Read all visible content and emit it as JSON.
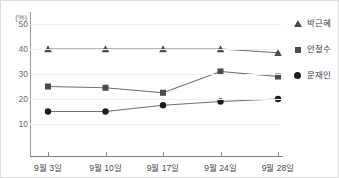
{
  "top_strip": {
    "cut_off_text": ""
  },
  "chart_data": {
    "type": "line",
    "title": "",
    "subtitle": "",
    "xlabel": "",
    "ylabel": "(%)",
    "unit": "(%)",
    "categories": [
      "9월 3일",
      "9월 10일",
      "9월 17일",
      "9월 24일",
      "9월 28일"
    ],
    "ylim": [
      0,
      55
    ],
    "yticks": [
      10,
      20,
      30,
      40,
      50
    ],
    "ytick_labels": [
      "10",
      "20",
      "30",
      "40",
      "50"
    ],
    "grid": true,
    "legend_position": "right",
    "series": [
      {
        "name": "박근혜",
        "marker": "triangle",
        "color": "#4a4a4f",
        "values": [
          40.0,
          40.0,
          40.0,
          40.0,
          38.5
        ]
      },
      {
        "name": "안철수",
        "marker": "square",
        "color": "#4a4a4f",
        "values": [
          25.0,
          24.5,
          22.5,
          31.0,
          29.0
        ]
      },
      {
        "name": "문재인",
        "marker": "circle",
        "color": "#1d1d20",
        "values": [
          15.0,
          15.0,
          17.5,
          19.0,
          20.0
        ]
      }
    ]
  },
  "legend": {
    "items": [
      {
        "label": "박근혜",
        "marker": "triangle"
      },
      {
        "label": "안철수",
        "marker": "square"
      },
      {
        "label": "문재인",
        "marker": "circle"
      }
    ]
  },
  "colors": {
    "line": "#6e6e73",
    "marker_dark": "#1d1d20",
    "marker_gray": "#4a4a4f",
    "grid": "#f0f0f2",
    "axis": "#8a8a8e",
    "text": "#4a4a4f",
    "background": "#ffffff"
  }
}
